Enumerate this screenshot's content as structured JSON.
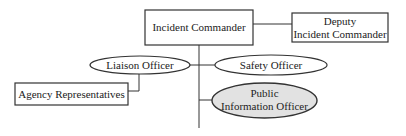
{
  "diagram": {
    "type": "org-chart",
    "nodes": {
      "incident_commander": {
        "lines": [
          "Incident Commander"
        ],
        "shape": "rectangle"
      },
      "deputy": {
        "lines": [
          "Deputy",
          "Incident Commander"
        ],
        "shape": "rectangle"
      },
      "liaison": {
        "lines": [
          "Liaison Officer"
        ],
        "shape": "ellipse"
      },
      "safety": {
        "lines": [
          "Safety Officer"
        ],
        "shape": "ellipse"
      },
      "agency": {
        "lines": [
          "Agency Representatives"
        ],
        "shape": "rectangle"
      },
      "pio": {
        "lines": [
          "Public",
          "Information Officer"
        ],
        "shape": "ellipse",
        "fill": "#e2e2e2"
      }
    },
    "edges": [
      [
        "incident_commander",
        "deputy"
      ],
      [
        "incident_commander",
        "liaison"
      ],
      [
        "incident_commander",
        "safety"
      ],
      [
        "incident_commander",
        "pio"
      ],
      [
        "liaison",
        "agency"
      ]
    ],
    "colors": {
      "stroke": "#333333",
      "text": "#222222",
      "pio_fill": "#e2e2e2",
      "background": "#ffffff"
    }
  }
}
